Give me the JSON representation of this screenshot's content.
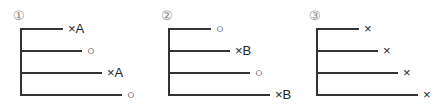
{
  "panels": [
    {
      "number": "①",
      "branches": [
        {
          "marker": "×A"
        },
        {
          "marker": "○"
        },
        {
          "marker": "×A"
        },
        {
          "marker": "○"
        }
      ]
    },
    {
      "number": "②",
      "branches": [
        {
          "marker": "○"
        },
        {
          "marker": "×B"
        },
        {
          "marker": "○"
        },
        {
          "marker": "×B"
        }
      ]
    },
    {
      "number": "③",
      "branches": [
        {
          "marker": "×"
        },
        {
          "marker": "×"
        },
        {
          "marker": "×"
        },
        {
          "marker": "×"
        }
      ]
    }
  ]
}
